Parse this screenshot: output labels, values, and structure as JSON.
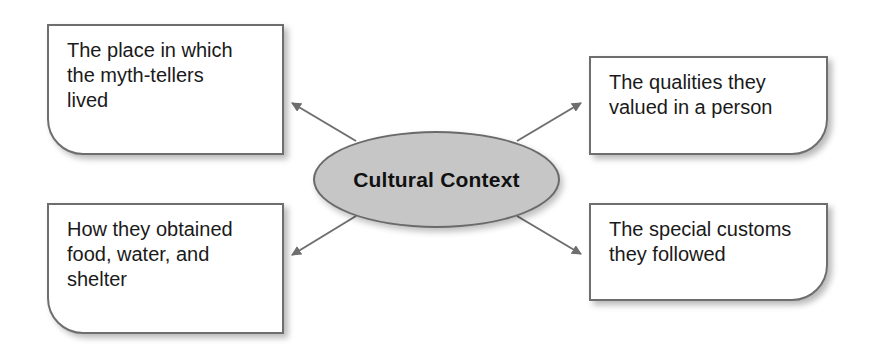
{
  "diagram": {
    "type": "concept-web",
    "center": {
      "label": "Cultural Context",
      "fill": "#c6c6c6",
      "stroke": "#6a6a6a"
    },
    "nodes": [
      {
        "id": "top-left",
        "lines": [
          "The place in which",
          "the myth-tellers",
          "lived"
        ]
      },
      {
        "id": "top-right",
        "lines": [
          "The qualities they",
          "valued in a person"
        ]
      },
      {
        "id": "bottom-left",
        "lines": [
          "How they obtained",
          "food, water, and",
          "shelter"
        ]
      },
      {
        "id": "bottom-right",
        "lines": [
          "The special customs",
          "they followed"
        ]
      }
    ],
    "arrow_color": "#6e6e6e"
  }
}
